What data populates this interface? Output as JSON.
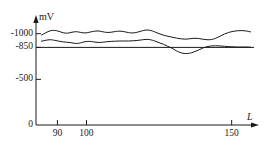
{
  "chart_data": {
    "type": "line",
    "title": "",
    "xlabel": "L",
    "ylabel": "mV",
    "xlim": [
      84,
      157
    ],
    "ylim": [
      0,
      -1150
    ],
    "grid": false,
    "legend": "none",
    "x_ticks": [
      {
        "value": 90,
        "label": "90"
      },
      {
        "value": 100,
        "label": "100"
      },
      {
        "value": 150,
        "label": "150"
      }
    ],
    "y_ticks": [
      {
        "value": -1000,
        "label": "-1000"
      },
      {
        "value": -850,
        "label": "-850"
      },
      {
        "value": -500,
        "label": "-500"
      },
      {
        "value": 0,
        "label": "0"
      }
    ],
    "annotations": [
      {
        "name": "reference-line",
        "type": "hline",
        "value": -850,
        "label": "-850"
      }
    ],
    "series": [
      {
        "name": "upper-curve",
        "color": "#1a1a1a",
        "x": [
          84.5,
          86,
          87.5,
          89,
          90.5,
          92,
          93.5,
          95,
          96.5,
          98,
          99.5,
          101,
          102.5,
          104,
          105.5,
          107,
          108.5,
          110,
          111.5,
          113,
          114.5,
          116,
          117.5,
          119,
          120.5,
          122,
          123.5,
          125,
          126.5,
          128,
          129.5,
          131,
          132.5,
          134,
          135.5,
          137,
          138.5,
          140,
          141.5,
          143,
          144.5,
          146,
          147.5,
          149,
          150.5,
          152,
          153.5,
          155,
          156.5
        ],
        "y": [
          -985,
          -1010,
          -1032,
          -1036,
          -1026,
          -1010,
          -1006,
          -1016,
          -1022,
          -1014,
          -1008,
          -1016,
          -1026,
          -1030,
          -1022,
          -1014,
          -1016,
          -1024,
          -1028,
          -1022,
          -1012,
          -1008,
          -1016,
          -1030,
          -1040,
          -1036,
          -1020,
          -1000,
          -984,
          -972,
          -962,
          -952,
          -944,
          -940,
          -944,
          -950,
          -948,
          -940,
          -934,
          -936,
          -950,
          -972,
          -996,
          -1014,
          -1026,
          -1032,
          -1034,
          -1030,
          -1020
        ]
      },
      {
        "name": "lower-curve",
        "color": "#1a1a1a",
        "x": [
          84.5,
          86,
          87.5,
          89,
          90.5,
          92,
          93.5,
          95,
          96.5,
          98,
          99.5,
          101,
          102.5,
          104,
          105.5,
          107,
          108.5,
          110,
          111.5,
          113,
          114.5,
          116,
          117.5,
          119,
          120.5,
          122,
          123.5,
          125,
          126.5,
          128,
          129.5,
          131,
          132.5,
          134,
          135.5,
          137,
          138.5,
          140,
          141.5,
          143,
          144.5,
          146,
          147.5,
          149,
          150.5,
          152,
          153.5,
          155,
          156.5
        ],
        "y": [
          -918,
          -928,
          -934,
          -928,
          -918,
          -910,
          -906,
          -900,
          -892,
          -900,
          -912,
          -916,
          -910,
          -904,
          -906,
          -912,
          -916,
          -918,
          -920,
          -920,
          -920,
          -922,
          -926,
          -932,
          -938,
          -934,
          -920,
          -902,
          -884,
          -862,
          -840,
          -812,
          -792,
          -782,
          -786,
          -800,
          -820,
          -842,
          -858,
          -866,
          -868,
          -866,
          -862,
          -858,
          -856,
          -854,
          -854,
          -854,
          -852
        ]
      }
    ]
  }
}
